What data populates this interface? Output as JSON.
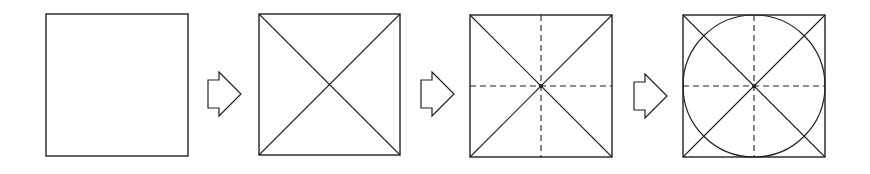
{
  "diagram": {
    "title": "Square to inscribed circle construction steps",
    "stroke_color": "#222222",
    "background": "#ffffff",
    "steps": [
      {
        "label": "Square",
        "x": 46,
        "y": 14,
        "size": 142,
        "diagonals": false,
        "center_lines": false,
        "circle": false
      },
      {
        "label": "Square with diagonals",
        "x": 259,
        "y": 14,
        "size": 141,
        "diagonals": true,
        "center_lines": false,
        "circle": false
      },
      {
        "label": "Square with diagonals and dashed center lines",
        "x": 470,
        "y": 15,
        "size": 142,
        "diagonals": true,
        "center_lines": true,
        "circle": false
      },
      {
        "label": "Square with diagonals, center lines and inscribed circle",
        "x": 683,
        "y": 15,
        "size": 142,
        "diagonals": true,
        "center_lines": true,
        "circle": true
      }
    ],
    "arrows": [
      {
        "label": "next-step",
        "x": 208,
        "y": 72
      },
      {
        "label": "next-step",
        "x": 421,
        "y": 72
      },
      {
        "label": "next-step",
        "x": 634,
        "y": 74
      }
    ]
  }
}
